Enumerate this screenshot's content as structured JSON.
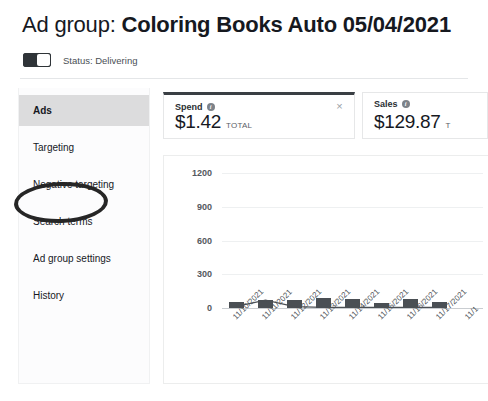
{
  "header": {
    "title_prefix": "Ad group:",
    "title_name": "Coloring Books Auto 05/04/2021",
    "status_label": "Status: Delivering",
    "toggle_state": "on"
  },
  "sidebar": {
    "items": [
      {
        "label": "Ads",
        "selected": true
      },
      {
        "label": "Targeting",
        "selected": false
      },
      {
        "label": "Negative targeting",
        "selected": false
      },
      {
        "label": "Search terms",
        "selected": false,
        "annotated": true
      },
      {
        "label": "Ad group settings",
        "selected": false
      },
      {
        "label": "History",
        "selected": false
      }
    ]
  },
  "metrics": [
    {
      "name": "Spend",
      "value": "$1.42",
      "unit": "TOTAL",
      "info_icon": "info-icon",
      "close_icon": "×",
      "active": true
    },
    {
      "name": "Sales",
      "value": "$129.87",
      "unit": "T",
      "info_icon": "info-icon",
      "active": false
    }
  ],
  "chart_data": {
    "type": "bar",
    "title": "",
    "xlabel": "",
    "ylabel": "",
    "ylim": [
      0,
      1200
    ],
    "yticks": [
      0,
      300,
      600,
      900,
      1200
    ],
    "grid": true,
    "legend": "none",
    "categories": [
      "11/10/2021",
      "11/11/2021",
      "11/12/2021",
      "11/13/2021",
      "11/14/2021",
      "11/15/2021",
      "11/16/2021",
      "11/17/2021",
      "11/1"
    ],
    "series": [
      {
        "name": "Sales",
        "type": "bar",
        "values": [
          55,
          75,
          70,
          85,
          80,
          45,
          80,
          50,
          null
        ]
      },
      {
        "name": "Spend",
        "type": "line",
        "values": [
          15,
          70,
          12,
          6,
          5,
          5,
          5,
          5,
          null
        ]
      }
    ]
  }
}
